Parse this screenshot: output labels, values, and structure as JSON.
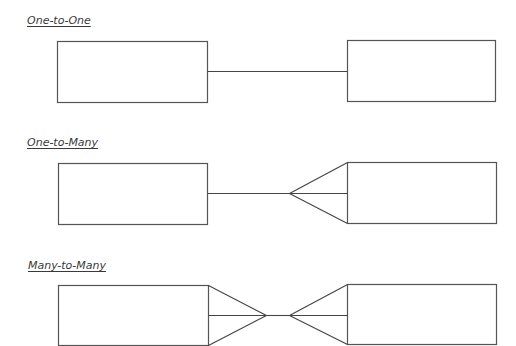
{
  "sections": [
    {
      "title": "One-to-One",
      "type": "one-to-one"
    },
    {
      "title": "One-to-Many",
      "type": "one-to-many"
    },
    {
      "title": "Many-to-Many",
      "type": "many-to-many"
    }
  ],
  "colors": {
    "stroke": "#555555",
    "label": "#3a3a3a",
    "background": "#ffffff"
  }
}
